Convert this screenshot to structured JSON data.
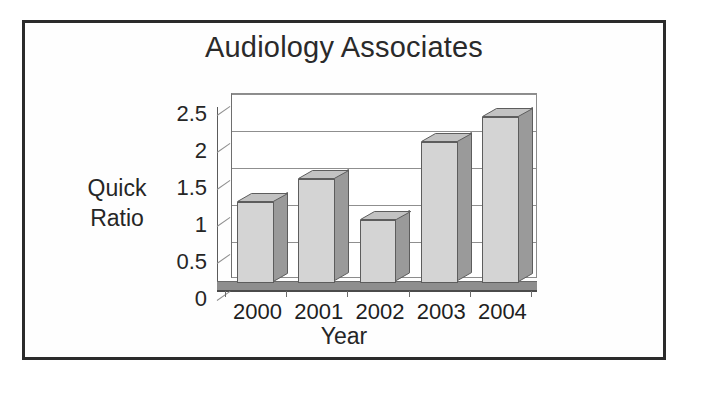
{
  "chart_data": {
    "type": "bar",
    "title": "Audiology Associates",
    "xlabel": "Year",
    "ylabel": "Quick Ratio",
    "ylabel_lines": [
      "Quick",
      "Ratio"
    ],
    "categories": [
      "2000",
      "2001",
      "2002",
      "2003",
      "2004"
    ],
    "values": [
      1.1,
      1.4,
      0.85,
      1.9,
      2.25
    ],
    "ylim": [
      0,
      2.5
    ],
    "ytick_labels": [
      "0",
      "0.5",
      "1",
      "1.5",
      "2",
      "2.5"
    ],
    "ytick_values": [
      0,
      0.5,
      1,
      1.5,
      2,
      2.5
    ],
    "grid": true,
    "legend": "none",
    "style": "3d-column",
    "colors": {
      "bar_face": "#d4d4d4",
      "bar_side": "#9a9a9a",
      "bar_top": "#c2c2c2",
      "outline": "#5d5d5d",
      "gridline": "#8f8f8f",
      "axis": "#4a4a4a",
      "text": "#262626",
      "border": "#2b2b2b",
      "background": "#ffffff"
    }
  }
}
